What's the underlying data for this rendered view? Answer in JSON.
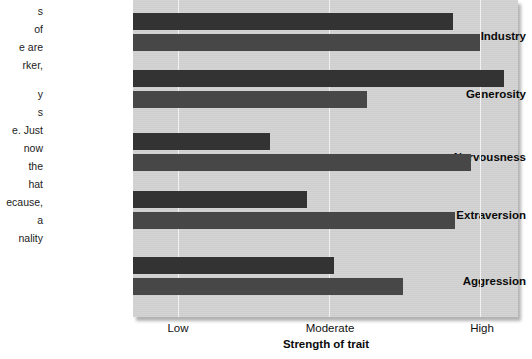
{
  "body_text": {
    "lines": [
      "s",
      "of",
      "e are",
      "rker,",
      "y",
      "s",
      "e. Just",
      "now",
      " the",
      "hat",
      "ecause,",
      "a",
      "nality"
    ]
  },
  "chart_data": {
    "type": "bar",
    "title": "",
    "xlabel": "Strength of trait",
    "ylabel": "",
    "orientation": "horizontal",
    "grid": true,
    "legend": false,
    "axis_tick_labels": [
      "Low",
      "Moderate",
      "High"
    ],
    "axis_tick_values": [
      1,
      2,
      3
    ],
    "xlim": [
      0.7,
      3.25
    ],
    "categories": [
      "Industry",
      "Generosity",
      "Nervousness",
      "Extraversion",
      "Aggression"
    ],
    "series": [
      {
        "name": "Pair bar 1",
        "color": "#333333",
        "values": [
          2.82,
          3.16,
          1.61,
          1.85,
          2.03
        ]
      },
      {
        "name": "Pair bar 2",
        "color": "#474747",
        "values": [
          3.0,
          2.25,
          2.94,
          2.83,
          2.49
        ]
      }
    ],
    "panel_color": "#d3d3d3",
    "gridline_color": "#f1f1f1"
  }
}
